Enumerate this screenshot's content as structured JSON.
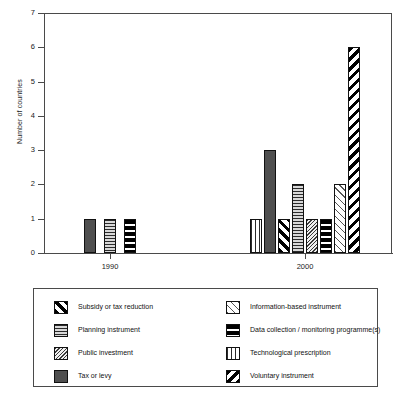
{
  "chart_data": {
    "type": "bar",
    "title": "",
    "xlabel": "",
    "ylabel": "Number of countries",
    "categories": [
      "1990",
      "2000"
    ],
    "ylim": [
      0,
      7
    ],
    "yticks": [
      "0",
      "1",
      "2",
      "3",
      "4",
      "5",
      "6",
      "7"
    ],
    "grid": false,
    "legend_position": "bottom",
    "series": [
      {
        "name": "Subsidy or tax reduction",
        "pattern": "p-subsidy",
        "values": [
          0,
          1
        ]
      },
      {
        "name": "Planning instrument",
        "pattern": "p-planning",
        "values": [
          1,
          2
        ]
      },
      {
        "name": "Public investment",
        "pattern": "p-publicinv",
        "values": [
          0,
          1
        ]
      },
      {
        "name": "Tax or levy",
        "pattern": "p-tax",
        "values": [
          1,
          3
        ]
      },
      {
        "name": "Information-based instrument",
        "pattern": "p-infobased",
        "values": [
          0,
          2
        ]
      },
      {
        "name": "Data collection / monitoring programme(s)",
        "pattern": "p-datacoll",
        "values": [
          1,
          1
        ]
      },
      {
        "name": "Technological prescription",
        "pattern": "p-technological",
        "values": [
          0,
          1
        ]
      },
      {
        "name": "Voluntary instrument",
        "pattern": "p-voluntary",
        "values": [
          0,
          6
        ]
      }
    ],
    "bars_1990": [
      {
        "label": "Tax or levy",
        "pattern": "p-tax",
        "value": 1
      },
      {
        "label": "Planning instrument",
        "pattern": "p-planning",
        "value": 1
      },
      {
        "label": "Data collection / monitoring programme(s)",
        "pattern": "p-datacoll",
        "value": 1
      }
    ],
    "bars_2000": [
      {
        "label": "Technological prescription",
        "pattern": "p-technological",
        "value": 1
      },
      {
        "label": "Tax or levy",
        "pattern": "p-tax",
        "value": 3
      },
      {
        "label": "Subsidy or tax reduction",
        "pattern": "p-subsidy",
        "value": 1
      },
      {
        "label": "Planning instrument",
        "pattern": "p-planning",
        "value": 2
      },
      {
        "label": "Public investment",
        "pattern": "p-publicinv",
        "value": 1
      },
      {
        "label": "Data collection / monitoring programme(s)",
        "pattern": "p-datacoll",
        "value": 1
      },
      {
        "label": "Information-based instrument",
        "pattern": "p-infobased",
        "value": 2
      },
      {
        "label": "Voluntary instrument",
        "pattern": "p-voluntary",
        "value": 6
      }
    ]
  },
  "axis": {
    "y_title": "Number of countries",
    "y_labels": [
      "7",
      "6",
      "5",
      "4",
      "3",
      "2",
      "1",
      "0"
    ],
    "x_labels": [
      "1990",
      "2000"
    ]
  },
  "legend": {
    "left_column": [
      {
        "label": "Subsidy or tax reduction",
        "pattern": "p-subsidy"
      },
      {
        "label": "Planning instrument",
        "pattern": "p-planning"
      },
      {
        "label": "Public investment",
        "pattern": "p-publicinv"
      },
      {
        "label": "Tax or levy",
        "pattern": "p-tax"
      }
    ],
    "right_column": [
      {
        "label": "Information-based instrument",
        "pattern": "p-infobased"
      },
      {
        "label": "Data collection / monitoring programme(s)",
        "pattern": "p-datacoll"
      },
      {
        "label": "Technological prescription",
        "pattern": "p-technological"
      },
      {
        "label": "Voluntary instrument",
        "pattern": "p-voluntary"
      }
    ]
  }
}
